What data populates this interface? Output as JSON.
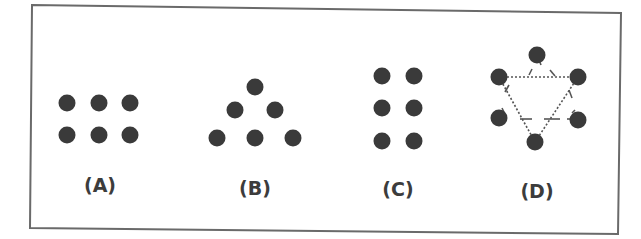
{
  "figure": {
    "dot_color": "#3a3a3a",
    "border_color": "#6a6a6a",
    "panels": [
      {
        "id": "A",
        "label": "(A)",
        "label_pos": [
          100,
          192
        ],
        "dots": [
          [
            67,
            103
          ],
          [
            99,
            103
          ],
          [
            130,
            103
          ],
          [
            67,
            135
          ],
          [
            99,
            135
          ],
          [
            130,
            135
          ]
        ]
      },
      {
        "id": "B",
        "label": "(B)",
        "label_pos": [
          255,
          195
        ],
        "dots": [
          [
            255,
            87
          ],
          [
            235,
            110
          ],
          [
            275,
            110
          ],
          [
            217,
            138
          ],
          [
            255,
            138
          ],
          [
            293,
            138
          ]
        ]
      },
      {
        "id": "C",
        "label": "(C)",
        "label_pos": [
          398,
          196
        ],
        "dots": [
          [
            382,
            76
          ],
          [
            414,
            76
          ],
          [
            382,
            108
          ],
          [
            414,
            108
          ],
          [
            382,
            141
          ],
          [
            414,
            141
          ]
        ]
      },
      {
        "id": "D",
        "label": "(D)",
        "label_pos": [
          537,
          198
        ],
        "dots": [
          [
            537,
            55
          ],
          [
            499,
            77
          ],
          [
            578,
            77
          ],
          [
            499,
            118
          ],
          [
            578,
            120
          ],
          [
            535,
            142
          ]
        ]
      }
    ]
  }
}
